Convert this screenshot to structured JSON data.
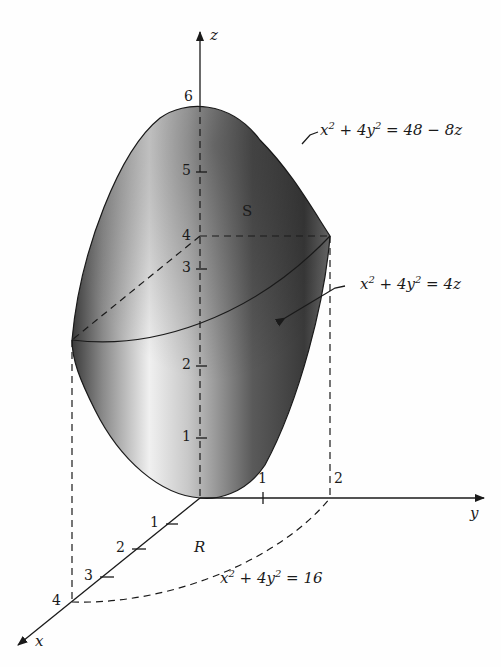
{
  "figure": {
    "axes": {
      "x_label": "x",
      "y_label": "y",
      "z_label": "z",
      "z_ticks": [
        "1",
        "2",
        "3",
        "4",
        "5",
        "6"
      ],
      "x_ticks": [
        "1",
        "2",
        "3",
        "4"
      ],
      "y_ticks": [
        "1",
        "2"
      ]
    },
    "surfaces": {
      "upper": {
        "x2": "x",
        "p2": "2",
        "mid": " + 4y",
        "p2b": "2",
        "rhs": " = 48 − 8z"
      },
      "lower": {
        "x2": "x",
        "p2": "2",
        "mid": " + 4y",
        "p2b": "2",
        "rhs": " = 4z"
      },
      "boundary": {
        "x2": "x",
        "p2": "2",
        "mid": " + 4y",
        "p2b": "2",
        "rhs": " = 16"
      }
    },
    "solid_label": "S",
    "region_label": "R",
    "colors": {
      "ink": "#1a1a1a",
      "shade_dark": "#2a2a2a",
      "shade_light": "#f2f2f2"
    }
  }
}
